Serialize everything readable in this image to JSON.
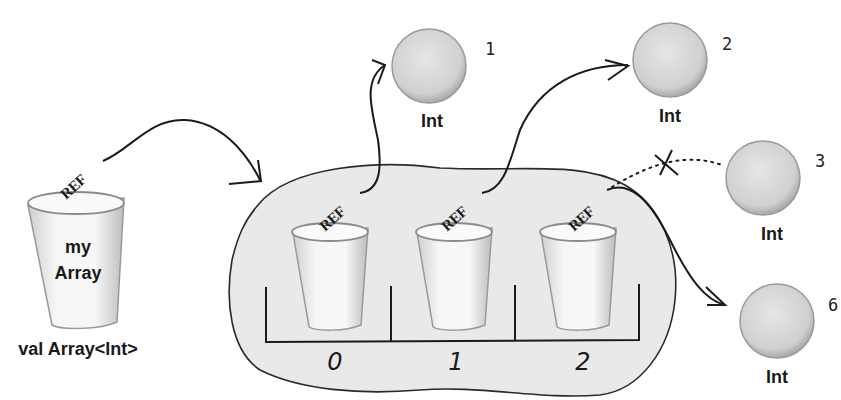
{
  "variable": {
    "name_line1": "my",
    "name_line2": "Array",
    "type_label": "val Array<Int>",
    "ref_label": "REF"
  },
  "array": {
    "slots": [
      {
        "index": "0",
        "ref_label": "REF",
        "points_to": "1"
      },
      {
        "index": "1",
        "ref_label": "REF",
        "points_to": "2"
      },
      {
        "index": "2",
        "ref_label": "REF",
        "points_to": "6",
        "previously_pointed_to": "3"
      }
    ]
  },
  "objects": [
    {
      "value": "1",
      "type": "Int"
    },
    {
      "value": "2",
      "type": "Int"
    },
    {
      "value": "3",
      "type": "Int",
      "status": "unreferenced"
    },
    {
      "value": "6",
      "type": "Int"
    }
  ],
  "colors": {
    "blob_fill": "#e8e8e8",
    "circle_fill": "#d9d9d9",
    "cup_fill": "#f4f4f4",
    "ink": "#1a1a1a"
  }
}
